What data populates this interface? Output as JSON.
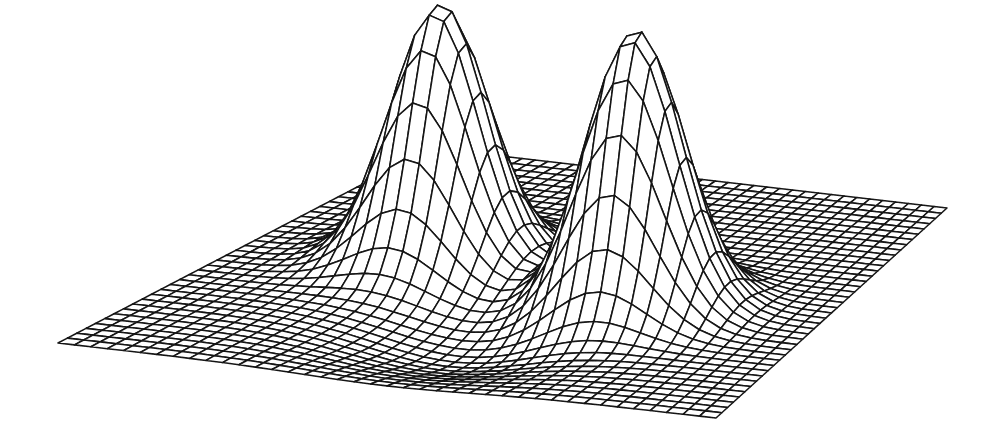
{
  "figure": {
    "kind": "3d-wireframe-surface",
    "title": "",
    "caption": "",
    "background_color": "#ffffff",
    "line_color": "#151515",
    "render_style": "scanned-halftone-wireframe"
  },
  "chart_data": {
    "type": "surface",
    "title": "",
    "subtitle": "",
    "xlabel": "",
    "ylabel": "",
    "zlabel": "",
    "grid": true,
    "legend": null,
    "axes_visible": false,
    "tick_labels_visible": false,
    "annotations": [],
    "mesh": {
      "nx": 41,
      "ny": 41,
      "x_range": [
        -3.0,
        3.0
      ],
      "y_range": [
        -3.0,
        3.0
      ],
      "z_range": [
        -0.12,
        1.0
      ]
    },
    "surface_function": "z = exp(-((x-1.15)^2 + (y-0.35)^2)/0.42) + 0.92*exp(-((x+1.15)^2 + (y+0.25)^2)/0.40) - 0.10*exp(-((x)^2+(y-1.6)^2)/1.2)",
    "peaks": [
      {
        "name": "right-peak",
        "screen_x": 658,
        "screen_y": 28,
        "relative_height": 1.0
      },
      {
        "name": "left-peak",
        "screen_x": 345,
        "screen_y": 70,
        "relative_height": 0.9
      }
    ],
    "base_plane_corners": {
      "left": [
        58,
        343
      ],
      "front": [
        716,
        418
      ],
      "right": [
        947,
        208
      ],
      "back": [
        432,
        148
      ]
    },
    "projection": {
      "type": "oblique-axonometric",
      "elevation_deg": 24,
      "azimuth_deg": 41
    },
    "series": [
      {
        "name": "gaussian-mixture-surface",
        "categories": [
          "peak-left",
          "saddle",
          "peak-right",
          "base-plane"
        ],
        "values": [
          0.9,
          0.18,
          1.0,
          0.0
        ]
      }
    ]
  }
}
